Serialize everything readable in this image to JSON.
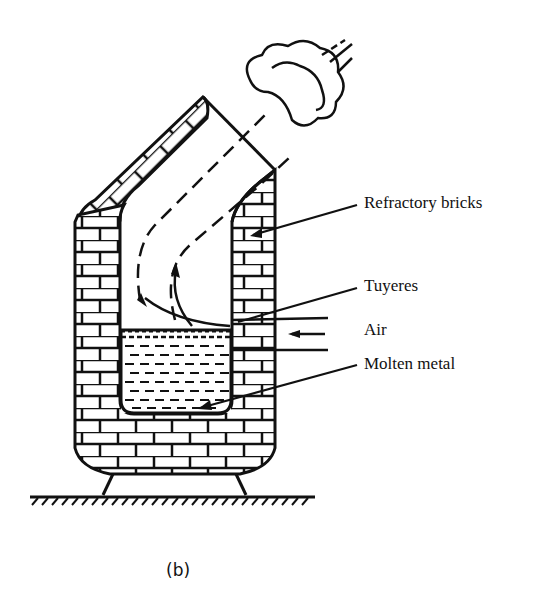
{
  "diagram": {
    "labels": {
      "refractory_bricks": "Refractory bricks",
      "tuyeres": "Tuyeres",
      "air": "Air",
      "molten_metal": "Molten metal"
    },
    "caption": "(b)",
    "colors": {
      "ink": "#111111",
      "background": "#ffffff"
    }
  }
}
